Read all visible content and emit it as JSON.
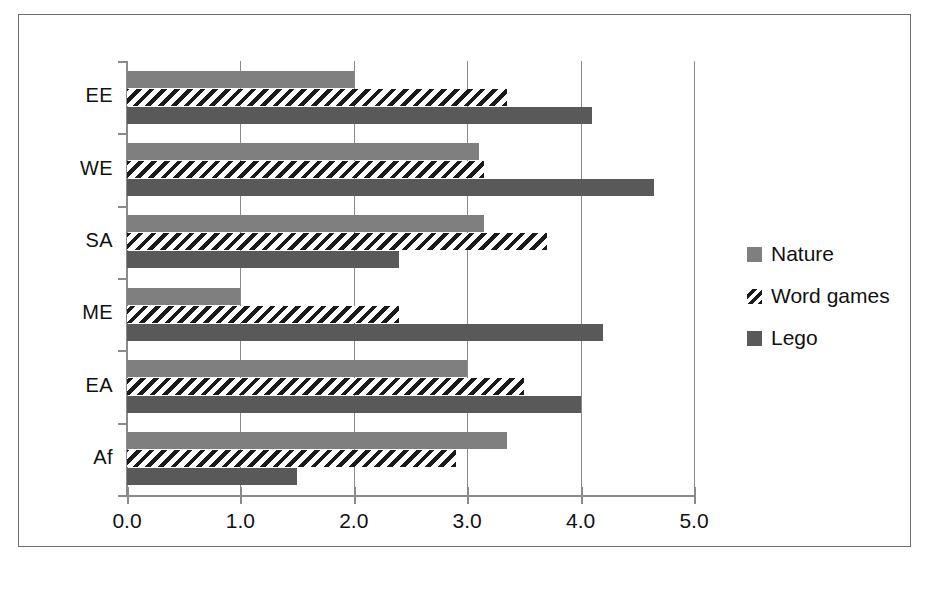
{
  "chart_data": {
    "type": "bar",
    "orientation": "horizontal",
    "title": "",
    "xlabel": "",
    "ylabel": "",
    "categories": [
      "EE",
      "WE",
      "SA",
      "ME",
      "EA",
      "Af"
    ],
    "series": [
      {
        "name": "Nature",
        "color": "#7f7f7f",
        "values": [
          2.0,
          3.1,
          3.15,
          1.0,
          3.0,
          3.35
        ]
      },
      {
        "name": "Word games",
        "color": "#1a1a1a",
        "values": [
          3.35,
          3.15,
          3.7,
          2.4,
          3.5,
          2.9
        ]
      },
      {
        "name": "Lego",
        "color": "#595959",
        "values": [
          4.1,
          4.65,
          2.4,
          4.2,
          4.0,
          1.5
        ]
      }
    ],
    "xlim": [
      0.0,
      5.0
    ],
    "xticks": [
      0.0,
      1.0,
      2.0,
      3.0,
      4.0,
      5.0
    ],
    "xticklabels": [
      "0.0",
      "1.0",
      "2.0",
      "3.0",
      "4.0",
      "5.0"
    ],
    "grid": true,
    "grid_axis": "x",
    "legend_position": "right"
  },
  "legend": {
    "items": [
      {
        "label": "Nature"
      },
      {
        "label": "Word games"
      },
      {
        "label": "Lego"
      }
    ]
  },
  "caption": ""
}
